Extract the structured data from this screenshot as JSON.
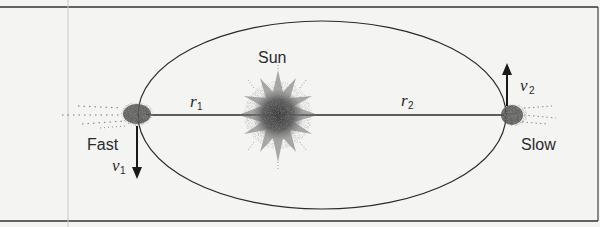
{
  "diagram": {
    "type": "orbit-diagram",
    "labels": {
      "sun": "Sun",
      "fast": "Fast",
      "slow": "Slow",
      "r1_base": "r",
      "r1_sub": "1",
      "r2_base": "r",
      "r2_sub": "2",
      "v1_base": "v",
      "v1_sub": "1",
      "v2_base": "v",
      "v2_sub": "2"
    },
    "colors": {
      "background": "#f4f4f2",
      "line": "#2a2a2a",
      "speckle": "#555555"
    },
    "geometry": {
      "ellipse": {
        "cx": 322,
        "cy": 115,
        "rx": 184,
        "ry": 94
      },
      "frame": {
        "x": 0,
        "y": 7,
        "width": 598,
        "height": 214
      },
      "sun": {
        "x": 278,
        "y": 115
      },
      "perihelion_body": {
        "x": 140,
        "y": 115
      },
      "aphelion_body": {
        "x": 512,
        "y": 115
      }
    }
  }
}
